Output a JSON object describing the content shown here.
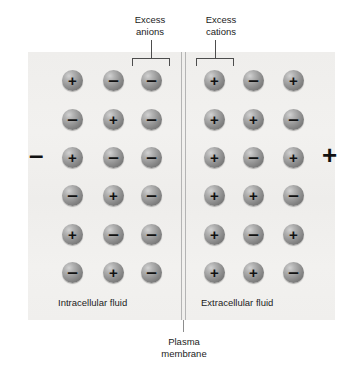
{
  "figure": {
    "panel_color": "#f1f0ee",
    "ion_color": "#8c8c8c",
    "line_color": "#b4b4b4"
  },
  "annotations": {
    "excess_anions_line1": "Excess",
    "excess_anions_line2": "anions",
    "excess_cations_line1": "Excess",
    "excess_cations_line2": "cations",
    "plasma_membrane_line1": "Plasma",
    "plasma_membrane_line2": "membrane"
  },
  "compartments": {
    "intracellular_label": "Intracellular fluid",
    "extracellular_label": "Extracellular fluid",
    "intracellular_polarity": "–",
    "extracellular_polarity": "+"
  },
  "ions": {
    "plus_glyph": "+",
    "minus_glyph": "–",
    "intracellular_rows": [
      [
        "+",
        "–",
        "–"
      ],
      [
        "–",
        "+",
        "–"
      ],
      [
        "+",
        "–",
        "–"
      ],
      [
        "–",
        "+",
        "–"
      ],
      [
        "+",
        "–",
        "–"
      ],
      [
        "–",
        "+",
        "–"
      ]
    ],
    "extracellular_rows": [
      [
        "+",
        "–",
        "+"
      ],
      [
        "+",
        "+",
        "–"
      ],
      [
        "+",
        "–",
        "+"
      ],
      [
        "+",
        "+",
        "–"
      ],
      [
        "+",
        "–",
        "+"
      ],
      [
        "+",
        "+",
        "–"
      ]
    ]
  },
  "layout": {
    "intracellular_columns_x": [
      62,
      103,
      141
    ],
    "extracellular_columns_x": [
      204,
      243,
      283
    ],
    "rows_y": [
      70,
      109,
      147,
      185,
      224,
      262
    ]
  }
}
